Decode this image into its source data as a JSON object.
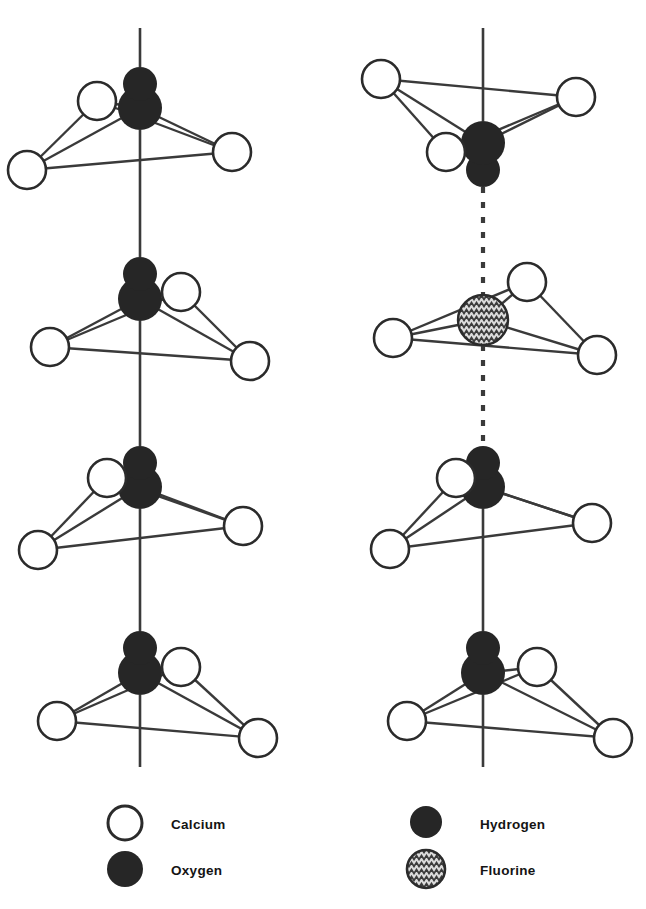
{
  "figure": {
    "background_color": "#ffffff",
    "line_color": "#3a3a3a",
    "atom_colors": {
      "calcium_fill": "#ffffff",
      "calcium_stroke": "#2b2b2b",
      "oxygen_fill": "#262626",
      "hydrogen_fill": "#262626",
      "fluorine_fill": "#d8d8d8",
      "fluorine_stroke": "#2b2b2b",
      "fluorine_hatch": "#3c3c3c"
    }
  },
  "columns": [
    {
      "name": "hydroxyapatite-column",
      "axis_x": 140,
      "units": [
        {
          "id": "left-unit-1",
          "orientation": "ca-upper-left",
          "center_y": 120,
          "group": "hydroxyl",
          "group_direction": "up",
          "bond_above": "solid",
          "bond_below": "solid",
          "calcium": [
            {
              "cx": 97,
              "cy": 101
            },
            {
              "cx": 27,
              "cy": 170
            },
            {
              "cx": 232,
              "cy": 152
            }
          ],
          "oxygen": {
            "cx": 140,
            "cy": 108,
            "r": 22
          },
          "hydrogen": {
            "cx": 140,
            "cy": 84,
            "r": 17
          }
        },
        {
          "id": "left-unit-2",
          "orientation": "ca-upper-right",
          "center_y": 310,
          "group": "hydroxyl",
          "group_direction": "up",
          "bond_above": "solid",
          "bond_below": "solid",
          "calcium": [
            {
              "cx": 181,
              "cy": 292
            },
            {
              "cx": 50,
              "cy": 347
            },
            {
              "cx": 250,
              "cy": 361
            }
          ],
          "oxygen": {
            "cx": 140,
            "cy": 299,
            "r": 22
          },
          "hydrogen": {
            "cx": 140,
            "cy": 274,
            "r": 17
          }
        },
        {
          "id": "left-unit-3",
          "orientation": "ca-upper-left",
          "center_y": 500,
          "group": "hydroxyl",
          "group_direction": "up",
          "bond_above": "solid",
          "bond_below": "solid",
          "calcium": [
            {
              "cx": 107,
              "cy": 478
            },
            {
              "cx": 38,
              "cy": 550
            },
            {
              "cx": 243,
              "cy": 526
            }
          ],
          "oxygen": {
            "cx": 140,
            "cy": 487,
            "r": 22
          },
          "hydrogen": {
            "cx": 140,
            "cy": 463,
            "r": 17
          }
        },
        {
          "id": "left-unit-4",
          "orientation": "ca-upper-right",
          "center_y": 690,
          "group": "hydroxyl",
          "group_direction": "up",
          "bond_above": "solid",
          "bond_below": "solid",
          "calcium": [
            {
              "cx": 181,
              "cy": 667
            },
            {
              "cx": 57,
              "cy": 721
            },
            {
              "cx": 258,
              "cy": 738
            }
          ],
          "oxygen": {
            "cx": 140,
            "cy": 673,
            "r": 22
          },
          "hydrogen": {
            "cx": 140,
            "cy": 648,
            "r": 17
          }
        }
      ]
    },
    {
      "name": "fluorapatite-column",
      "axis_x": 483,
      "units": [
        {
          "id": "right-unit-1",
          "orientation": "ca-lower-left-inverted",
          "center_y": 120,
          "group": "hydroxyl",
          "group_direction": "down",
          "bond_above": "solid",
          "bond_below": "dashed",
          "calcium": [
            {
              "cx": 381,
              "cy": 79
            },
            {
              "cx": 576,
              "cy": 97
            },
            {
              "cx": 446,
              "cy": 152
            }
          ],
          "oxygen": {
            "cx": 483,
            "cy": 143,
            "r": 22
          },
          "hydrogen": {
            "cx": 483,
            "cy": 170,
            "r": 17
          }
        },
        {
          "id": "right-unit-2",
          "orientation": "ca-upper-right-fluorine",
          "center_y": 310,
          "group": "fluorine",
          "group_direction": "center",
          "bond_above": "dashed",
          "bond_below": "dashed",
          "calcium": [
            {
              "cx": 527,
              "cy": 282
            },
            {
              "cx": 393,
              "cy": 338
            },
            {
              "cx": 597,
              "cy": 355
            }
          ],
          "fluorine": {
            "cx": 483,
            "cy": 320,
            "r": 25
          }
        },
        {
          "id": "right-unit-3",
          "orientation": "ca-upper-left",
          "center_y": 500,
          "group": "hydroxyl",
          "group_direction": "up",
          "bond_above": "dashed",
          "bond_below": "solid",
          "calcium": [
            {
              "cx": 456,
              "cy": 478
            },
            {
              "cx": 390,
              "cy": 549
            },
            {
              "cx": 592,
              "cy": 523
            }
          ],
          "oxygen": {
            "cx": 483,
            "cy": 487,
            "r": 22
          },
          "hydrogen": {
            "cx": 483,
            "cy": 463,
            "r": 17
          }
        },
        {
          "id": "right-unit-4",
          "orientation": "ca-upper-right",
          "center_y": 690,
          "group": "hydroxyl",
          "group_direction": "up",
          "bond_above": "solid",
          "bond_below": "solid",
          "calcium": [
            {
              "cx": 537,
              "cy": 667
            },
            {
              "cx": 407,
              "cy": 721
            },
            {
              "cx": 613,
              "cy": 738
            }
          ],
          "oxygen": {
            "cx": 483,
            "cy": 673,
            "r": 22
          },
          "hydrogen": {
            "cx": 483,
            "cy": 648,
            "r": 17
          }
        }
      ]
    }
  ],
  "legend": {
    "entries": [
      {
        "id": "legend-calcium",
        "label": "Calcium",
        "symbol": "open-circle",
        "marker_cx": 125,
        "marker_cy": 823,
        "marker_r": 17,
        "label_x": 171,
        "label_y": 829
      },
      {
        "id": "legend-oxygen",
        "label": "Oxygen",
        "symbol": "filled-circle",
        "marker_cx": 125,
        "marker_cy": 869,
        "marker_r": 18,
        "label_x": 171,
        "label_y": 875
      },
      {
        "id": "legend-hydrogen",
        "label": "Hydrogen",
        "symbol": "filled-circle-small",
        "marker_cx": 426,
        "marker_cy": 822,
        "marker_r": 16,
        "label_x": 480,
        "label_y": 829
      },
      {
        "id": "legend-fluorine",
        "label": "Fluorine",
        "symbol": "zigzag-hatched-circle",
        "marker_cx": 426,
        "marker_cy": 869,
        "marker_r": 19,
        "label_x": 480,
        "label_y": 875
      }
    ]
  }
}
